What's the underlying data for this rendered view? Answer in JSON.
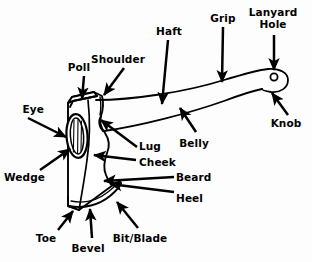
{
  "diagram": {
    "background_color": "#fdfdfd",
    "ink_color": "#000000",
    "line_style": "black ink line drawing with solid arrow pointers"
  },
  "labels": [
    {
      "id": "eye",
      "text": "Eye",
      "x": 8,
      "y": 104,
      "align": "left"
    },
    {
      "id": "wedge",
      "text": "Wedge",
      "x": 4,
      "y": 172,
      "align": "left"
    },
    {
      "id": "poll",
      "text": "Poll",
      "x": 79,
      "y": 62,
      "align": "center"
    },
    {
      "id": "shoulder",
      "text": "Shoulder",
      "x": 117,
      "y": 54,
      "align": "center"
    },
    {
      "id": "haft",
      "text": "Haft",
      "x": 169,
      "y": 26,
      "align": "center"
    },
    {
      "id": "grip",
      "text": "Grip",
      "x": 222,
      "y": 13,
      "align": "center"
    },
    {
      "id": "lanyard-hole",
      "text": "Lanyard\nHole",
      "x": 271,
      "y": 7,
      "align": "center"
    },
    {
      "id": "knob",
      "text": "Knob",
      "x": 286,
      "y": 118,
      "align": "center"
    },
    {
      "id": "belly",
      "text": "Belly",
      "x": 193,
      "y": 138,
      "align": "center"
    },
    {
      "id": "lug",
      "text": "Lug",
      "x": 139,
      "y": 141,
      "align": "left"
    },
    {
      "id": "cheek",
      "text": "Cheek",
      "x": 139,
      "y": 157,
      "align": "left"
    },
    {
      "id": "beard",
      "text": "Beard",
      "x": 176,
      "y": 172,
      "align": "left"
    },
    {
      "id": "heel",
      "text": "Heel",
      "x": 176,
      "y": 193,
      "align": "left"
    },
    {
      "id": "toe",
      "text": "Toe",
      "x": 46,
      "y": 233,
      "align": "center"
    },
    {
      "id": "bevel",
      "text": "Bevel",
      "x": 88,
      "y": 243,
      "align": "center"
    },
    {
      "id": "bit-blade",
      "text": "Bit/Blade",
      "x": 140,
      "y": 233,
      "align": "center"
    }
  ],
  "parts": [
    "Eye",
    "Wedge",
    "Poll",
    "Shoulder",
    "Haft",
    "Grip",
    "Lanyard Hole",
    "Knob",
    "Belly",
    "Lug",
    "Cheek",
    "Beard",
    "Heel",
    "Toe",
    "Bevel",
    "Bit/Blade"
  ]
}
